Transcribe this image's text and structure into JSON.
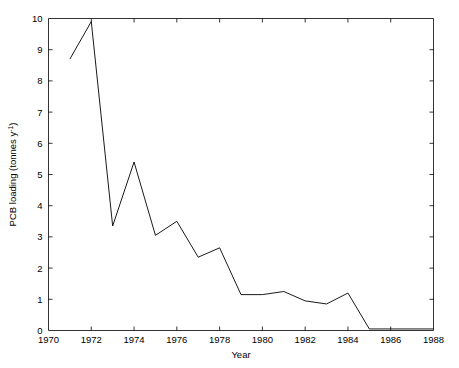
{
  "chart_data": {
    "type": "line",
    "title": "",
    "xlabel": "Year",
    "ylabel": "PCB loading (tonnes y",
    "ylabel_sup": "-1",
    "ylabel_tail": ")",
    "xlim": [
      1970,
      1988
    ],
    "ylim": [
      0,
      10
    ],
    "grid": false,
    "legend": null,
    "xticks": [
      1970,
      1972,
      1974,
      1976,
      1978,
      1980,
      1982,
      1984,
      1986,
      1988
    ],
    "xtick_labels": [
      "1970",
      "1972",
      "1974",
      "1976",
      "1978",
      "1980",
      "1982",
      "1984",
      "1986",
      "1988"
    ],
    "yticks": [
      0,
      1,
      2,
      3,
      4,
      5,
      6,
      7,
      8,
      9,
      10
    ],
    "ytick_labels": [
      "0",
      "1",
      "2",
      "3",
      "4",
      "5",
      "6",
      "7",
      "8",
      "9",
      "10"
    ],
    "x": [
      1971,
      1972,
      1973,
      1974,
      1975,
      1976,
      1977,
      1978,
      1979,
      1980,
      1981,
      1982,
      1983,
      1984,
      1985,
      1986,
      1987,
      1988
    ],
    "values": [
      8.7,
      9.9,
      3.35,
      5.4,
      3.05,
      3.5,
      2.35,
      2.65,
      1.15,
      1.15,
      1.25,
      0.95,
      0.85,
      1.2,
      0.05,
      0.05,
      0.05,
      0.05
    ],
    "series_name": "PCB loading"
  }
}
